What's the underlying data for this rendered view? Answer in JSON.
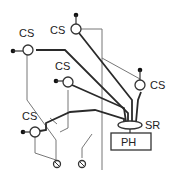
{
  "diagram": {
    "sensor_label": "CS",
    "sensors": [
      {
        "id": "cs-1",
        "label": "CS",
        "position": "upper-left"
      },
      {
        "id": "cs-2",
        "label": "CS",
        "position": "top-center"
      },
      {
        "id": "cs-3",
        "label": "CS",
        "position": "middle"
      },
      {
        "id": "cs-4",
        "label": "CS",
        "position": "right"
      },
      {
        "id": "cs-5",
        "label": "CS",
        "position": "lower-left"
      }
    ],
    "ring_label": "SR",
    "box_label": "PH",
    "ground_terminals": 2
  }
}
